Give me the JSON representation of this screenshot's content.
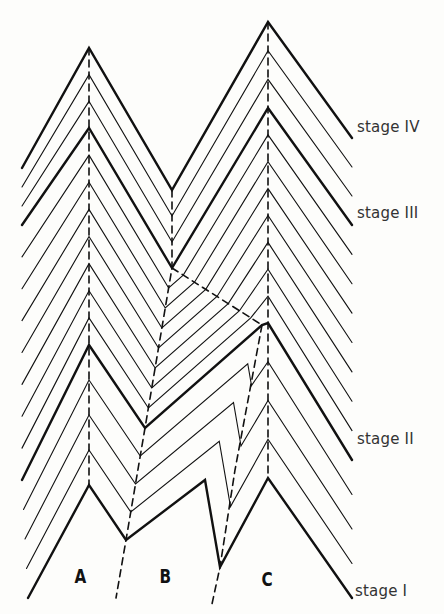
{
  "diagram": {
    "stage_labels": [
      {
        "text": "stage IV",
        "x": 357,
        "y": 118
      },
      {
        "text": "stage III",
        "x": 357,
        "y": 204
      },
      {
        "text": "stage II",
        "x": 357,
        "y": 430
      },
      {
        "text": "stage I",
        "x": 355,
        "y": 582
      }
    ],
    "column_labels": [
      {
        "text": "A",
        "x": 73,
        "y": 565
      },
      {
        "text": "B",
        "x": 158,
        "y": 565
      },
      {
        "text": "C",
        "x": 260,
        "y": 568
      }
    ],
    "colors": {
      "ink": "#111111",
      "background": "#fdfdfb"
    },
    "bold_layers": [
      {
        "name": "stage-I-surface",
        "points": [
          [
            28,
            598
          ],
          [
            89,
            485
          ],
          [
            126,
            540
          ],
          [
            205,
            480
          ],
          [
            220,
            567
          ],
          [
            268,
            478
          ],
          [
            352,
            598
          ]
        ]
      },
      {
        "name": "stage-II-surface",
        "points": [
          [
            22,
            480
          ],
          [
            89,
            345
          ],
          [
            145,
            428
          ],
          [
            262,
            325
          ],
          [
            268,
            323
          ],
          [
            352,
            460
          ]
        ]
      },
      {
        "name": "stage-III-surface",
        "points": [
          [
            22,
            225
          ],
          [
            89,
            128
          ],
          [
            172,
            268
          ],
          [
            268,
            108
          ],
          [
            352,
            225
          ]
        ]
      },
      {
        "name": "stage-IV-surface",
        "points": [
          [
            22,
            168
          ],
          [
            89,
            48
          ],
          [
            172,
            190
          ],
          [
            268,
            22
          ],
          [
            352,
            138
          ]
        ]
      }
    ],
    "axes_dashed": [
      {
        "name": "axis-A",
        "points": [
          [
            89,
            48
          ],
          [
            89,
            485
          ]
        ]
      },
      {
        "name": "axis-B",
        "points": [
          [
            172,
            190
          ],
          [
            172,
            268
          ],
          [
            145,
            428
          ],
          [
            126,
            540
          ],
          [
            116,
            598
          ]
        ]
      },
      {
        "name": "axis-C",
        "points": [
          [
            268,
            22
          ],
          [
            268,
            478
          ]
        ]
      },
      {
        "name": "axis-B-C-link",
        "points": [
          [
            172,
            268
          ],
          [
            262,
            325
          ]
        ]
      },
      {
        "name": "axis-C-secondary",
        "points": [
          [
            262,
            325
          ],
          [
            235,
            470
          ],
          [
            220,
            567
          ],
          [
            212,
            604
          ]
        ]
      }
    ]
  }
}
